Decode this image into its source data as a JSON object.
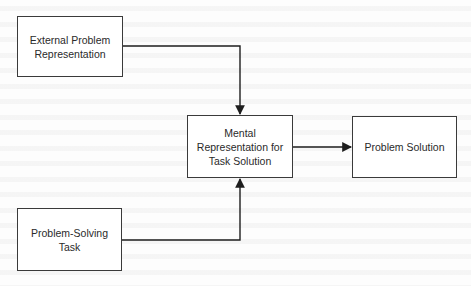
{
  "diagram": {
    "type": "flowchart",
    "colors": {
      "box_border": "#3a3a3a",
      "text": "#2a2a2a",
      "connector": "#1e1e1e",
      "background": "#fdfdfd"
    },
    "nodes": [
      {
        "id": "external_problem_representation",
        "label": "External Problem\nRepresentation"
      },
      {
        "id": "mental_representation",
        "label": "Mental\nRepresentation for\nTask Solution"
      },
      {
        "id": "problem_solution",
        "label": "Problem Solution"
      },
      {
        "id": "problem_solving_task",
        "label": "Problem-Solving\nTask"
      }
    ],
    "edges": [
      {
        "from": "external_problem_representation",
        "to": "mental_representation",
        "style": "elbow-arrow"
      },
      {
        "from": "problem_solving_task",
        "to": "mental_representation",
        "style": "elbow-arrow"
      },
      {
        "from": "mental_representation",
        "to": "problem_solution",
        "style": "straight-arrow"
      }
    ]
  }
}
